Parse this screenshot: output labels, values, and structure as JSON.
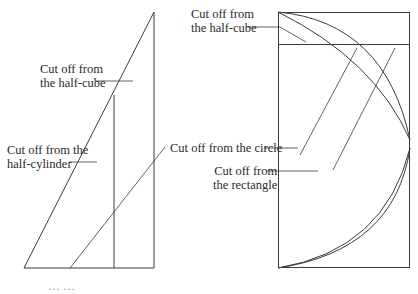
{
  "figure": {
    "left_panel": {
      "labels": [
        {
          "id": "half-cube",
          "line1": "Cut off from",
          "line2": "the half-cube"
        },
        {
          "id": "half-cylinder",
          "line1": "Cut off from the",
          "line2": "half-cylinder"
        }
      ]
    },
    "right_panel": {
      "labels": [
        {
          "id": "half-cube",
          "line1": "Cut off from",
          "line2": "the half-cube"
        },
        {
          "id": "circle",
          "line1": "Cut off from the circle"
        },
        {
          "id": "rectangle",
          "line1": "Cut off from",
          "line2": "the rectangle"
        }
      ]
    },
    "caption_partial": "…  …"
  },
  "colors": {
    "stroke": "#3a3a3a",
    "text": "#2a2a2a",
    "background": "#ffffff"
  }
}
